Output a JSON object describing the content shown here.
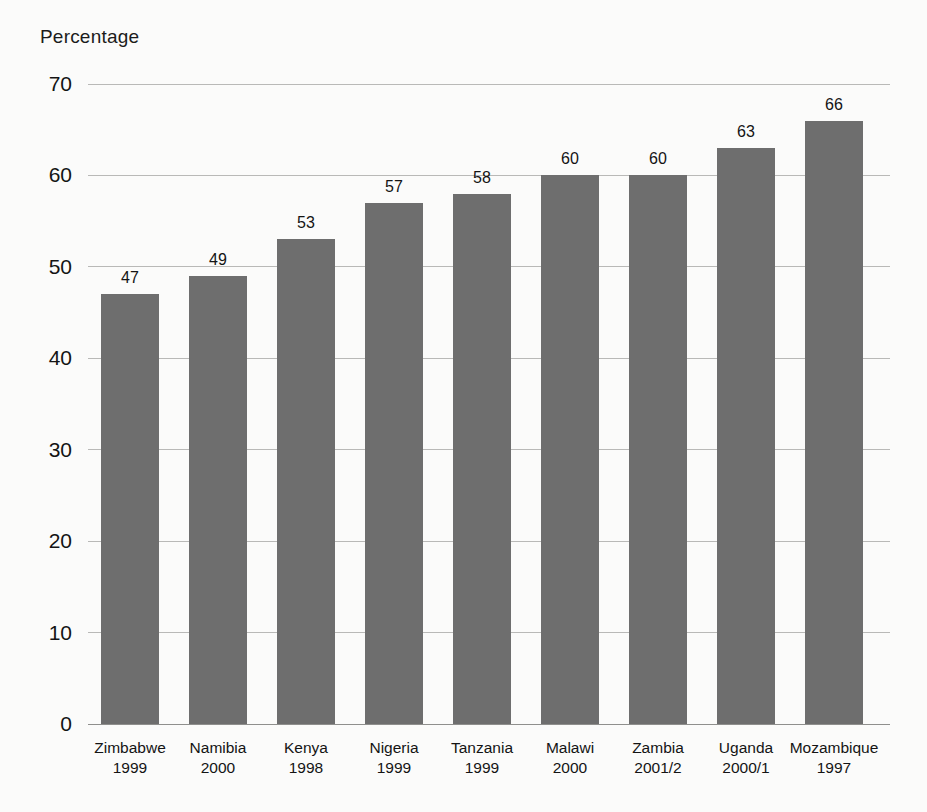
{
  "chart_data": {
    "type": "bar",
    "title": "",
    "ylabel": "Percentage",
    "xlabel": "",
    "ylim": [
      0,
      70
    ],
    "yticks": [
      0,
      10,
      20,
      30,
      40,
      50,
      60,
      70
    ],
    "grid": true,
    "legend": null,
    "orientation": "vertical",
    "bar_color": "#6e6e6e",
    "categories": [
      "Zimbabwe",
      "Namibia",
      "Kenya",
      "Nigeria",
      "Tanzania",
      "Malawi",
      "Zambia",
      "Uganda",
      "Mozambique"
    ],
    "category_years": [
      "1999",
      "2000",
      "1998",
      "1999",
      "1999",
      "2000",
      "2001/2",
      "2000/1",
      "1997"
    ],
    "values": [
      47,
      49,
      53,
      57,
      58,
      60,
      60,
      63,
      66
    ],
    "value_labels": [
      "47",
      "49",
      "53",
      "57",
      "58",
      "60",
      "60",
      "63",
      "66"
    ]
  }
}
